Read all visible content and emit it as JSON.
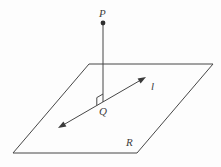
{
  "figure": {
    "labels": {
      "point_above_plane": "P",
      "foot_of_perpendicular": "Q",
      "line_in_plane": "l",
      "plane": "R"
    },
    "elements": [
      "plane parallelogram labeled R",
      "point P with filled dot above plane",
      "vertical segment from P down to Q",
      "right-angle marker at Q between segment PQ and line l",
      "double-arrowed line l through Q lying in the plane"
    ],
    "colors": {
      "line": "#474747",
      "label_text": "#3d3d3d",
      "background": "#fdfdfd"
    }
  }
}
